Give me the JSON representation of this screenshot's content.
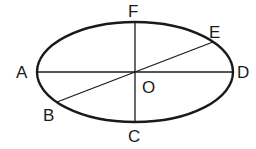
{
  "diagram": {
    "shape": "ellipse",
    "center": {
      "x": 135,
      "y": 72
    },
    "rx": 98,
    "ry": 50,
    "stroke_color": "#1a1a1a",
    "labels": {
      "A": "A",
      "B": "B",
      "C": "C",
      "D": "D",
      "E": "E",
      "F": "F",
      "O": "O"
    },
    "segments": [
      {
        "from": "A",
        "to": "D",
        "type": "major-axis"
      },
      {
        "from": "F",
        "to": "C",
        "type": "minor-axis"
      },
      {
        "from": "B",
        "to": "E",
        "type": "diameter-through-O"
      }
    ]
  }
}
